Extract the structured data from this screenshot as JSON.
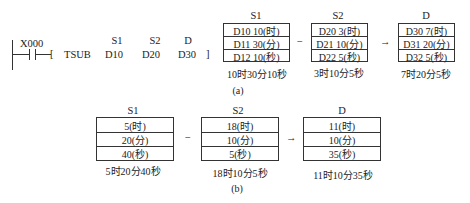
{
  "ladder": {
    "contact": "X000",
    "instruction": "TSUB",
    "operand_labels": [
      "S1",
      "S2",
      "D"
    ],
    "operands": [
      "D10",
      "D20",
      "D30"
    ],
    "close_bracket": "]",
    "open_bracket": "["
  },
  "part_a": {
    "caption": "(a)",
    "minus": "−",
    "arrow": "→",
    "s1": {
      "label": "S1",
      "rows": [
        "D10  10(时)",
        "D11  30(分)",
        "D12  10(秒)"
      ],
      "summary": "10时30分10秒"
    },
    "s2": {
      "label": "S2",
      "rows": [
        "D20   3(时)",
        "D21  10(分)",
        "D22   5(秒)"
      ],
      "summary": "3时10分5秒"
    },
    "d": {
      "label": "D",
      "rows": [
        "D30   7(时)",
        "D31  20(分)",
        "D32   5(秒)"
      ],
      "summary": "7时20分5秒"
    }
  },
  "part_b": {
    "caption": "(b)",
    "minus": "−",
    "arrow": "→",
    "s1": {
      "label": "S1",
      "rows": [
        "5(时)",
        "20(分)",
        "40(秒)"
      ],
      "summary": "5时20分40秒"
    },
    "s2": {
      "label": "S2",
      "rows": [
        "18(时)",
        "10(分)",
        "5(秒)"
      ],
      "summary": "18时10分5秒"
    },
    "d": {
      "label": "D",
      "rows": [
        "11(时)",
        "10(分)",
        "35(秒)"
      ],
      "summary": "11时10分35秒"
    }
  }
}
